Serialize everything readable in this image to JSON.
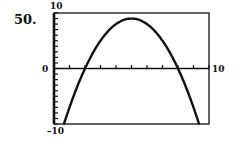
{
  "problem_number": "50.",
  "chart_data": {
    "type": "line",
    "title": "",
    "xlabel": "",
    "ylabel": "",
    "xlim": [
      0,
      10
    ],
    "ylim": [
      -10,
      10
    ],
    "x_tick_labels": [
      "0",
      "10"
    ],
    "y_tick_labels": [
      "10",
      "-10"
    ],
    "x_ticks_step": 1,
    "y_ticks_step": 1,
    "grid": false,
    "legend": null,
    "series": [
      {
        "name": "y = -x^2 + 10x - 16",
        "function": "-(x-2)*(x-8)",
        "vertex": [
          5,
          9
        ],
        "roots": [
          2,
          8
        ],
        "x": [
          0.6,
          1,
          2,
          3,
          4,
          5,
          6,
          7,
          8,
          9,
          9.4
        ],
        "values": [
          -10.4,
          -7,
          0,
          5,
          8,
          9,
          8,
          5,
          0,
          -7,
          -10.4
        ]
      }
    ]
  },
  "labels": {
    "y_max": "10",
    "y_min": "–10",
    "x_origin": "0",
    "x_max": "10"
  }
}
